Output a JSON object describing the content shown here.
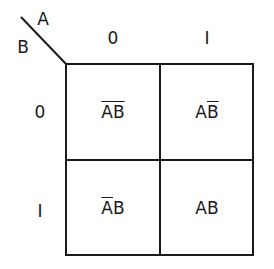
{
  "kmap": {
    "var_top": "A",
    "var_left": "B",
    "col_headers": [
      "0",
      "I"
    ],
    "row_headers": [
      "0",
      "I"
    ],
    "cells": [
      [
        {
          "parts": [
            {
              "t": "A",
              "bar": true
            },
            {
              "t": "B",
              "bar": true
            }
          ]
        },
        {
          "parts": [
            {
              "t": "A",
              "bar": false
            },
            {
              "t": "B",
              "bar": true
            }
          ]
        }
      ],
      [
        {
          "parts": [
            {
              "t": "A",
              "bar": true
            },
            {
              "t": "B",
              "bar": false
            }
          ]
        },
        {
          "parts": [
            {
              "t": "A",
              "bar": false
            },
            {
              "t": "B",
              "bar": false
            }
          ]
        }
      ]
    ],
    "cell_text": {
      "r0c0": [
        "A",
        "B"
      ],
      "r0c1": [
        "A",
        "B"
      ],
      "r1c0": [
        "A",
        "B"
      ],
      "r1c1": [
        "A",
        "B"
      ]
    }
  }
}
